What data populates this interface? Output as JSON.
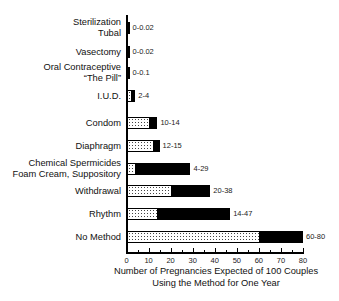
{
  "chart_data": {
    "type": "bar",
    "orientation": "horizontal",
    "stacked_range": true,
    "title": "",
    "xlabel": "Number of Pregnancies Expected of 100 Couples Using the Method for One Year",
    "xlabel_lines": [
      "Number of Pregnancies Expected of 100 Couples",
      "Using the Method for One Year"
    ],
    "ylabel": "",
    "xlim": [
      0,
      80
    ],
    "xticks": [
      0,
      10,
      20,
      30,
      40,
      50,
      60,
      70,
      80
    ],
    "grid": false,
    "legend": null,
    "categories": [
      {
        "lines": [
          "Sterilization",
          "Tubal"
        ],
        "low": 0,
        "high": 0.02,
        "label": "0-0.02"
      },
      {
        "lines": [
          "Vasectomy"
        ],
        "low": 0,
        "high": 0.02,
        "label": "0-0.02"
      },
      {
        "lines": [
          "Oral Contraceptive",
          "“The Pill”"
        ],
        "low": 0,
        "high": 0.1,
        "label": "0-0.1"
      },
      {
        "lines": [
          "I.U.D."
        ],
        "low": 2,
        "high": 4,
        "label": "2-4"
      },
      {
        "lines": [
          "Condom"
        ],
        "low": 10,
        "high": 14,
        "label": "10-14"
      },
      {
        "lines": [
          "Diaphragm"
        ],
        "low": 12,
        "high": 15,
        "label": "12-15"
      },
      {
        "lines": [
          "Chemical Spermicides",
          "Foam Cream, Suppository"
        ],
        "low": 4,
        "high": 29,
        "label": "4-29"
      },
      {
        "lines": [
          "Withdrawal"
        ],
        "low": 20,
        "high": 38,
        "label": "20-38"
      },
      {
        "lines": [
          "Rhythm"
        ],
        "low": 14,
        "high": 47,
        "label": "14-47"
      },
      {
        "lines": [
          "No Method"
        ],
        "low": 60,
        "high": 80,
        "label": "60-80"
      }
    ],
    "series": [
      {
        "name": "Minimum (dotted)",
        "values": [
          0,
          0,
          0,
          2,
          10,
          12,
          4,
          20,
          14,
          60
        ]
      },
      {
        "name": "Maximum (solid black)",
        "values": [
          0.02,
          0.02,
          0.1,
          4,
          14,
          15,
          29,
          38,
          47,
          80
        ]
      }
    ]
  }
}
